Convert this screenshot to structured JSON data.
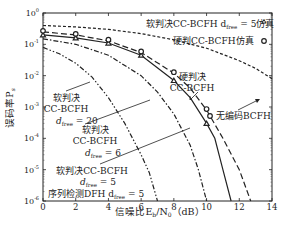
{
  "chart_data": {
    "type": "line",
    "title": "",
    "xlabel": "信噪比E_b/N_0（dB）",
    "ylabel": "误码率P_s",
    "xlim": [
      0,
      14
    ],
    "ylim": [
      1e-06,
      1
    ],
    "yscale": "log",
    "x_ticks": [
      "0",
      "2",
      "4",
      "6",
      "8",
      "10",
      "12",
      "14"
    ],
    "y_ticks": [
      "10^0",
      "10^-1",
      "10^-2",
      "10^-3",
      "10^-4",
      "10^-5",
      "10^-6"
    ],
    "grid": false,
    "series": [
      {
        "name": "无编码BCFH",
        "style": "short-dash",
        "x": [
          0,
          2,
          4,
          6,
          8,
          10,
          12,
          13,
          14
        ],
        "y": [
          0.4,
          0.36,
          0.3,
          0.22,
          0.14,
          0.075,
          0.03,
          0.017,
          0.008
        ]
      },
      {
        "name": "硬判决CC-BCFH",
        "style": "long-dash",
        "x": [
          0,
          2,
          4,
          6,
          8,
          9,
          10,
          11,
          12,
          12.7
        ],
        "y": [
          0.25,
          0.2,
          0.13,
          0.055,
          0.012,
          0.004,
          0.0008,
          0.0001,
          1e-05,
          1e-06
        ]
      },
      {
        "name": "软判决CC-BCFH d_free=5",
        "style": "solid",
        "x": [
          0,
          2,
          4,
          6,
          8,
          9,
          10,
          10.5,
          11,
          11.5
        ],
        "y": [
          0.2,
          0.16,
          0.11,
          0.045,
          0.007,
          0.002,
          0.0003,
          0.0001,
          1e-05,
          1e-06
        ]
      },
      {
        "name": "软判决CC-BCFH d_free=6",
        "style": "dash-dot",
        "x": [
          0,
          2,
          4,
          6,
          7,
          8,
          9,
          9.5,
          10
        ],
        "y": [
          0.15,
          0.1,
          0.045,
          0.01,
          0.003,
          0.0006,
          6e-05,
          1e-05,
          1e-06
        ]
      },
      {
        "name": "软判决CC-BCFH d_free=20",
        "style": "dash-dot-dot",
        "x": [
          0,
          1,
          2,
          3,
          4,
          5,
          6,
          6.5,
          7
        ],
        "y": [
          0.08,
          0.05,
          0.025,
          0.009,
          0.002,
          0.0003,
          3e-05,
          8e-06,
          1e-06
        ]
      },
      {
        "name": "软判决CC-BCFH d_free=5仿真",
        "style": "markers-triangle",
        "x": [
          0,
          2,
          4,
          6,
          8,
          10
        ],
        "y": [
          0.2,
          0.16,
          0.11,
          0.045,
          0.007,
          0.0003
        ]
      },
      {
        "name": "硬判CC-BCFH仿真",
        "style": "markers-circle",
        "x": [
          0,
          2,
          4,
          6,
          8,
          10
        ],
        "y": [
          0.25,
          0.2,
          0.13,
          0.055,
          0.012,
          0.0008
        ]
      }
    ],
    "annotations": [
      "软判决CC-BCFH d_free=5仿真",
      "硬判CC-BCFH仿真",
      "硬判决 CC-BCFH",
      "无编码BCFH",
      "软判决 CC-BCFH d_free=20",
      "软判决 CC-BCFH d_free=6",
      "软判决CC-BCFH d_free=5",
      "序列检测DFH d_free=5"
    ],
    "legend_position": "top-right"
  },
  "labels": {
    "xlabel": "信噪比E",
    "xlabel_sub1": "b",
    "xlabel_mid": "/N",
    "xlabel_sub2": "0",
    "xlabel_unit": "（dB）",
    "ylabel": "误码率P",
    "ylabel_sub": "s",
    "legend1": "软判决CC-BCFH d",
    "legend1_sub": "free",
    "legend1_tail": " = 5仿真",
    "legend2": "硬判CC-BCFH仿真",
    "hard_l1": "硬判决",
    "hard_l2": "CC-BCFH",
    "uncoded": "无编码BCFH",
    "soft20_l1": "软判决",
    "soft20_l2": "CC-BCFH",
    "soft20_l3": " = 20",
    "soft6_l1": "软判决",
    "soft6_l2": "CC-BCFH",
    "soft6_l3": " = 6",
    "soft5_l1": "软判决CC-BCFH",
    "soft5_l2": " = 5",
    "dfh": "序列检测DFH d",
    "dfh_tail": " = 5",
    "d": "d",
    "free": "free"
  }
}
